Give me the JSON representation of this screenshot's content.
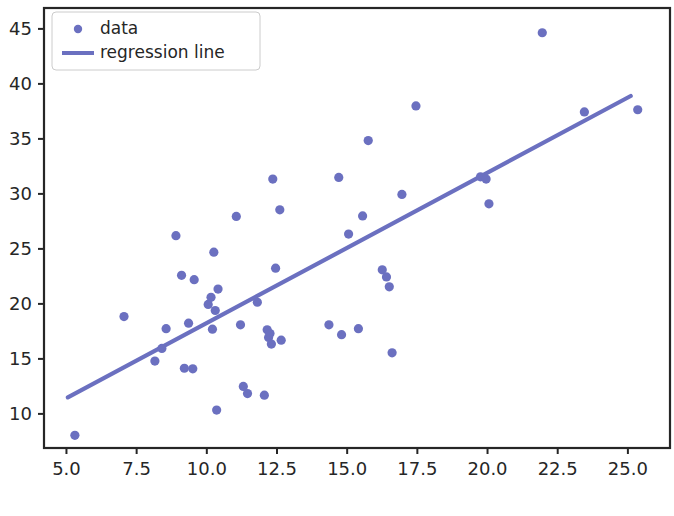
{
  "chart_data": {
    "type": "scatter",
    "title": "",
    "xlabel": "",
    "ylabel": "",
    "xlim": [
      4.2,
      26.5
    ],
    "ylim": [
      6.9,
      46.9
    ],
    "grid": false,
    "legend_position": "upper left",
    "accent_color": "#6b70c0",
    "axis_color": "#262626",
    "xticks": [
      "5.0",
      "7.5",
      "10.0",
      "12.5",
      "15.0",
      "17.5",
      "20.0",
      "22.5",
      "25.0"
    ],
    "xtick_values": [
      5.0,
      7.5,
      10.0,
      12.5,
      15.0,
      17.5,
      20.0,
      22.5,
      25.0
    ],
    "yticks": [
      "10",
      "15",
      "20",
      "25",
      "30",
      "35",
      "40",
      "45"
    ],
    "ytick_values": [
      10,
      15,
      20,
      25,
      30,
      35,
      40,
      45
    ],
    "series": [
      {
        "name": "data",
        "type": "scatter",
        "marker": "circle",
        "color": "#6b70c0",
        "points": [
          [
            5.3,
            8.05
          ],
          [
            7.05,
            18.85
          ],
          [
            8.15,
            14.8
          ],
          [
            8.4,
            15.95
          ],
          [
            8.55,
            17.75
          ],
          [
            8.9,
            26.2
          ],
          [
            9.1,
            22.6
          ],
          [
            9.2,
            14.15
          ],
          [
            9.35,
            18.25
          ],
          [
            9.5,
            14.1
          ],
          [
            9.55,
            22.2
          ],
          [
            10.05,
            19.95
          ],
          [
            10.15,
            20.6
          ],
          [
            10.2,
            17.7
          ],
          [
            10.25,
            24.7
          ],
          [
            10.3,
            19.4
          ],
          [
            10.35,
            10.35
          ],
          [
            10.4,
            21.35
          ],
          [
            11.05,
            27.95
          ],
          [
            11.2,
            18.1
          ],
          [
            11.3,
            12.5
          ],
          [
            11.45,
            11.85
          ],
          [
            11.8,
            20.15
          ],
          [
            12.05,
            11.7
          ],
          [
            12.15,
            17.65
          ],
          [
            12.2,
            16.95
          ],
          [
            12.25,
            17.3
          ],
          [
            12.3,
            16.35
          ],
          [
            12.35,
            31.35
          ],
          [
            12.45,
            23.25
          ],
          [
            12.6,
            28.55
          ],
          [
            12.65,
            16.7
          ],
          [
            14.35,
            18.1
          ],
          [
            14.7,
            31.5
          ],
          [
            14.8,
            17.2
          ],
          [
            15.05,
            26.35
          ],
          [
            15.4,
            17.75
          ],
          [
            15.55,
            28.0
          ],
          [
            15.75,
            34.85
          ],
          [
            16.25,
            23.1
          ],
          [
            16.4,
            22.45
          ],
          [
            16.5,
            21.55
          ],
          [
            16.6,
            15.55
          ],
          [
            16.95,
            29.95
          ],
          [
            17.45,
            38.0
          ],
          [
            19.75,
            31.55
          ],
          [
            19.95,
            31.35
          ],
          [
            20.05,
            29.1
          ],
          [
            21.95,
            44.65
          ],
          [
            23.45,
            37.45
          ],
          [
            25.35,
            37.65
          ]
        ]
      },
      {
        "name": "regression line",
        "type": "line",
        "color": "#6b70c0",
        "x": [
          5.05,
          25.1
        ],
        "y": [
          11.5,
          38.9
        ],
        "slope": 1.366,
        "intercept": 4.6
      }
    ],
    "legend": [
      {
        "label": "data",
        "marker": "circle",
        "color": "#6b70c0"
      },
      {
        "label": "regression line",
        "marker": "line",
        "color": "#6b70c0"
      }
    ]
  }
}
